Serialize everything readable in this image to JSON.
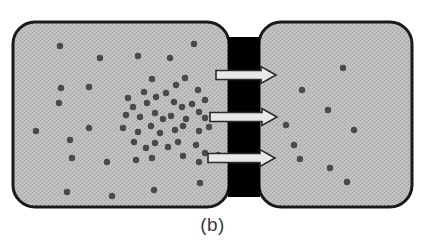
{
  "figure": {
    "caption": "(b)",
    "canvas": {
      "width": 425,
      "height": 251,
      "background": "#ffffff"
    }
  },
  "colors": {
    "chamber_fill": "#b9b9b9",
    "chamber_texture_dot": "#9a9a9a",
    "chamber_border": "#1a1a1a",
    "membrane_block": "#000000",
    "particle": "#4a4a4a",
    "arrow_outline": "#2a2a2a",
    "arrow_fill": "#e8e8e8",
    "caption_text": "#3a3a3a"
  },
  "chambers": [
    {
      "name": "left-chamber",
      "label": "high concentration chamber",
      "x": 13,
      "y": 22,
      "width": 216,
      "height": 185,
      "corner_radius": 22,
      "border_width": 3
    },
    {
      "name": "right-chamber",
      "label": "low concentration chamber",
      "x": 259,
      "y": 22,
      "width": 153,
      "height": 185,
      "corner_radius": 22,
      "border_width": 3
    }
  ],
  "membrane": {
    "name": "porous-membrane",
    "x": 228,
    "width": 32,
    "block_count": 4,
    "blocks": [
      {
        "y": 37,
        "height": 33
      },
      {
        "y": 80,
        "height": 33
      },
      {
        "y": 122,
        "height": 31
      },
      {
        "y": 163,
        "height": 34
      }
    ]
  },
  "arrows": {
    "name": "diffusion-arrows",
    "count": 3,
    "direction": "right",
    "items": [
      {
        "y": 75,
        "x_start": 216,
        "x_end": 276,
        "thickness": 9
      },
      {
        "y": 117,
        "x_start": 210,
        "x_end": 277,
        "thickness": 9
      },
      {
        "y": 158,
        "x_start": 208,
        "x_end": 275,
        "thickness": 9
      }
    ]
  },
  "particles": {
    "name": "gas-particles",
    "radius": 3.2,
    "left_chamber_count": 52,
    "right_chamber_count": 9,
    "left": [
      [
        60,
        46
      ],
      [
        100,
        58
      ],
      [
        138,
        56
      ],
      [
        170,
        58
      ],
      [
        194,
        44
      ],
      [
        89,
        87
      ],
      [
        152,
        79
      ],
      [
        176,
        85
      ],
      [
        185,
        78
      ],
      [
        128,
        98
      ],
      [
        144,
        92
      ],
      [
        156,
        97
      ],
      [
        166,
        93
      ],
      [
        198,
        90
      ],
      [
        205,
        100
      ],
      [
        61,
        88
      ],
      [
        59,
        103
      ],
      [
        133,
        107
      ],
      [
        147,
        103
      ],
      [
        174,
        102
      ],
      [
        182,
        107
      ],
      [
        192,
        104
      ],
      [
        199,
        112
      ],
      [
        126,
        115
      ],
      [
        140,
        117
      ],
      [
        155,
        113
      ],
      [
        163,
        119
      ],
      [
        171,
        116
      ],
      [
        186,
        119
      ],
      [
        205,
        118
      ],
      [
        36,
        131
      ],
      [
        89,
        128
      ],
      [
        123,
        128
      ],
      [
        138,
        132
      ],
      [
        151,
        126
      ],
      [
        160,
        133
      ],
      [
        175,
        130
      ],
      [
        183,
        126
      ],
      [
        199,
        131
      ],
      [
        209,
        127
      ],
      [
        70,
        140
      ],
      [
        134,
        142
      ],
      [
        146,
        148
      ],
      [
        155,
        143
      ],
      [
        168,
        147
      ],
      [
        178,
        142
      ],
      [
        196,
        145
      ],
      [
        205,
        153
      ],
      [
        72,
        158
      ],
      [
        107,
        162
      ],
      [
        136,
        160
      ],
      [
        152,
        158
      ],
      [
        183,
        156
      ],
      [
        199,
        162
      ],
      [
        67,
        192
      ],
      [
        112,
        196
      ],
      [
        154,
        190
      ],
      [
        200,
        183
      ],
      [
        218,
        155
      ]
    ],
    "right": [
      [
        343,
        68
      ],
      [
        302,
        90
      ],
      [
        328,
        110
      ],
      [
        286,
        125
      ],
      [
        354,
        130
      ],
      [
        294,
        145
      ],
      [
        300,
        159
      ],
      [
        330,
        168
      ],
      [
        347,
        182
      ]
    ]
  }
}
